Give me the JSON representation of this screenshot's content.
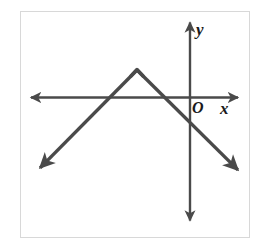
{
  "figure": {
    "name": "absolute-value-graph",
    "background_color": "#ffffff",
    "border_color": "#d8d8d8",
    "stroke_color": "#4a4a4a",
    "label_color": "#1a1a1a"
  },
  "labels": {
    "y_axis": "y",
    "origin": "O",
    "x_axis": "x"
  },
  "chart_data": {
    "type": "line",
    "title": "",
    "xlabel": "x",
    "ylabel": "y",
    "origin_label": "O",
    "grid": false,
    "legend": null,
    "axes": {
      "x_axis": {
        "pixel_y": 97,
        "from_px": [
          31,
          97
        ],
        "to_px": [
          238,
          97
        ],
        "arrow_both_ends": true,
        "label": "x",
        "label_px": [
          225,
          108
        ]
      },
      "y_axis": {
        "pixel_x": 190,
        "from_px": [
          190,
          22
        ],
        "to_px": [
          190,
          220
        ],
        "arrow_both_ends": true,
        "label": "y",
        "label_px": [
          200,
          29
        ]
      },
      "origin_px": [
        190,
        97
      ]
    },
    "series": [
      {
        "name": "inverted-absolute-value",
        "shape": "V-inverted",
        "vertex_px": [
          137,
          70
        ],
        "left_endpoint_px": [
          38,
          170
        ],
        "right_endpoint_px": [
          240,
          172
        ],
        "arrow_at_endpoints": true,
        "left_slope_sign": "positive",
        "right_slope_sign": "negative",
        "x_intercepts_px": [
          110,
          164
        ],
        "y_intercept_px": [
          190,
          130
        ]
      }
    ]
  }
}
